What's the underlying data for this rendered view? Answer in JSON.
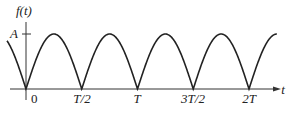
{
  "chart_data": {
    "type": "line",
    "title": "",
    "function": "f(t) = A|sin(2πt/T)| (full-wave rectified sine)",
    "ylabel": "f(t)",
    "xlabel": "t",
    "y_ticks": [
      {
        "label": "A",
        "value": 1
      }
    ],
    "x_ticks": [
      {
        "label": "0",
        "value": 0
      },
      {
        "label": "T/2",
        "value": 0.5
      },
      {
        "label": "T",
        "value": 1
      },
      {
        "label": "3T/2",
        "value": 1.5
      },
      {
        "label": "2T",
        "value": 2
      }
    ],
    "x_range": [
      -0.2,
      2.25
    ],
    "y_range": [
      0,
      1.1
    ],
    "grid": false,
    "legend": null,
    "color": "#222222"
  },
  "labels": {
    "ylabel": "f(t)",
    "xlabel": "t",
    "amp": "A",
    "x0": "0",
    "x1": "T/2",
    "x2": "T",
    "x3": "3T/2",
    "x4": "2T"
  }
}
